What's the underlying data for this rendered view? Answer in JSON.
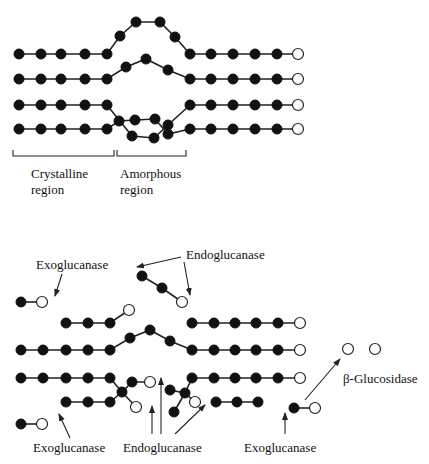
{
  "figure": {
    "top": {
      "labels": {
        "crystalline": [
          "Crystalline",
          "region"
        ],
        "amorphous": [
          "Amorphous",
          "region"
        ]
      }
    },
    "bottom": {
      "labels": {
        "exo_top": "Exoglucanase",
        "endo_top": "Endoglucanase",
        "beta_glucosidase": "β-Glucosidase",
        "exo_bottom_left": "Exoglucanase",
        "endo_bottom": "Endoglucanase",
        "exo_bottom_right": "Exoglucanase"
      }
    },
    "colors": {
      "glucose_unit": "#111111",
      "reducing_end": "#ffffff",
      "line": "#222222"
    },
    "legend": {
      "filled_circle": "glucose unit",
      "open_circle": "reducing end"
    }
  }
}
